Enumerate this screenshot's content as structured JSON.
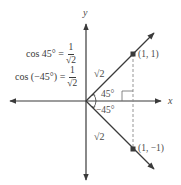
{
  "figure": {
    "axes": {
      "x_label": "x",
      "y_label": "y"
    },
    "equations": [
      {
        "lhs": "cos 45° =",
        "numerator": "1",
        "denominator": "√2"
      },
      {
        "lhs": "cos (−45°) =",
        "numerator": "1",
        "denominator": "√2"
      }
    ],
    "points": [
      {
        "label": "(1, 1)",
        "x": 1,
        "y": 1
      },
      {
        "label": "(1, −1)",
        "x": 1,
        "y": -1
      }
    ],
    "segment_labels": {
      "upper_hypotenuse": "√2",
      "lower_hypotenuse": "√2"
    },
    "angles": {
      "positive": "45°",
      "negative": "−45°"
    },
    "colors": {
      "line": "#3a3a3a",
      "dashed": "#8a8a8a",
      "point": "#3a3a3a",
      "text": "#4a4a4a"
    }
  }
}
